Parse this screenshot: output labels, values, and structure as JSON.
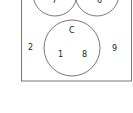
{
  "diagram": {
    "type": "venn",
    "stroke_color": "#555555",
    "sets": [
      {
        "name": "A",
        "label": "",
        "region_value": "7"
      },
      {
        "name": "B",
        "label": "",
        "region_value": "6"
      },
      {
        "name": "C",
        "label": "C",
        "region_values": [
          "1",
          "8"
        ]
      }
    ],
    "intersection_AB": "",
    "outside_values": [
      "2",
      "9"
    ]
  }
}
